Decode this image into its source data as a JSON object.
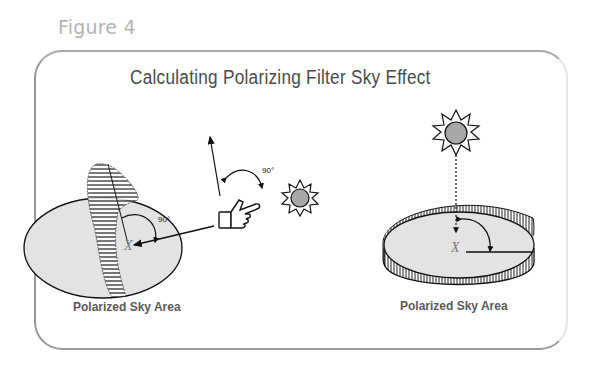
{
  "figure": {
    "label": "Figure 4",
    "title": "Calculating Polarizing Filter Sky Effect"
  },
  "left_diagram": {
    "caption": "Polarized Sky Area",
    "angle_labels": [
      "90°",
      "90°"
    ],
    "point_label": "X",
    "elements": [
      "sky-ellipse",
      "polarized-band",
      "pointing-hand",
      "sun",
      "arrow-up",
      "arrow-to-x"
    ]
  },
  "right_diagram": {
    "caption": "Polarized Sky Area",
    "point_label": "X",
    "elements": [
      "sky-disc-with-polarized-rim",
      "sun-overhead",
      "dashed-arrow-down",
      "angle-arc"
    ]
  },
  "colors": {
    "figure_label": "#b3b3b3",
    "title": "#4a4a4a",
    "caption": "#5a5a5a",
    "sky_fill": "#e3e3e3",
    "sun_fill": "#a8a8a8",
    "border": "#9a9a9a"
  }
}
